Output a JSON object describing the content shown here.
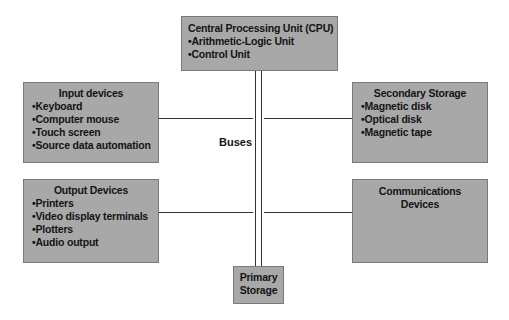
{
  "diagram": {
    "cpu": {
      "title": "Central Processing Unit (CPU)",
      "items": [
        "Arithmetic-Logic Unit",
        "Control Unit"
      ]
    },
    "input": {
      "title": "Input devices",
      "items": [
        "Keyboard",
        "Computer mouse",
        "Touch screen",
        "Source data automation"
      ]
    },
    "output": {
      "title": "Output Devices",
      "items": [
        "Printers",
        "Video display terminals",
        "Plotters",
        "Audio output"
      ]
    },
    "secondary": {
      "title": "Secondary Storage",
      "items": [
        "Magnetic disk",
        "Optical disk",
        "Magnetic tape"
      ]
    },
    "communications": {
      "title_line1": "Communications",
      "title_line2": "Devices"
    },
    "primary": {
      "title_line1": "Primary",
      "title_line2": "Storage"
    },
    "buses_label": "Buses",
    "colors": {
      "box_fill": "#a8a8a8",
      "box_border": "#7a7a7a",
      "line": "#333333"
    }
  }
}
